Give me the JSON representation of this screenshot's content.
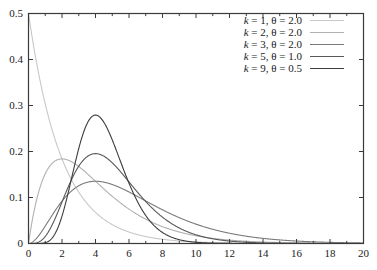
{
  "chart_data": {
    "type": "line",
    "title": "",
    "xlabel": "",
    "ylabel": "",
    "xlim": [
      0,
      20
    ],
    "ylim": [
      0,
      0.5
    ],
    "grid": false,
    "legend_position": "top-right",
    "x_ticks": [
      0,
      2,
      4,
      6,
      8,
      10,
      12,
      14,
      16,
      18,
      20
    ],
    "x_tick_labels": [
      "0",
      "2",
      "4",
      "6",
      "8",
      "10",
      "12",
      "14",
      "16",
      "18",
      "20"
    ],
    "x_minor_ticks": [
      1,
      3,
      5,
      7,
      9,
      11,
      13,
      15,
      17,
      19
    ],
    "y_ticks": [
      0,
      0.1,
      0.2,
      0.3,
      0.4,
      0.5
    ],
    "y_tick_labels": [
      "0",
      "0.1",
      "0.2",
      "0.3",
      "0.4",
      "0.5"
    ],
    "series": [
      {
        "name": "k = 1, θ = 2.0",
        "k": 1,
        "theta": 2.0,
        "color": "#c8c8c8",
        "width": 1.1,
        "peak_x": 0,
        "peak_y": 0.5
      },
      {
        "name": "k = 2, θ = 2.0",
        "k": 2,
        "theta": 2.0,
        "color": "#b0b0b0",
        "width": 1.1,
        "peak_x": 2,
        "peak_y": 0.184
      },
      {
        "name": "k = 3, θ = 2.0",
        "k": 3,
        "theta": 2.0,
        "color": "#7a7a7a",
        "width": 1.1,
        "peak_x": 4,
        "peak_y": 0.135
      },
      {
        "name": "k = 5, θ = 1.0",
        "k": 5,
        "theta": 1.0,
        "color": "#585858",
        "width": 1.1,
        "peak_x": 4,
        "peak_y": 0.195
      },
      {
        "name": "k = 9, θ = 0.5",
        "k": 9,
        "theta": 0.5,
        "color": "#3c3c3c",
        "width": 1.1,
        "peak_x": 4,
        "peak_y": 0.279
      }
    ]
  },
  "legend": {
    "entries": [
      {
        "k_part": "k",
        "rest": " = 1, θ = 2.0"
      },
      {
        "k_part": "k",
        "rest": " = 2, θ = 2.0"
      },
      {
        "k_part": "k",
        "rest": " = 3, θ = 2.0"
      },
      {
        "k_part": "k",
        "rest": " = 5, θ = 1.0"
      },
      {
        "k_part": "k",
        "rest": " = 9, θ = 0.5"
      }
    ]
  },
  "frame": {
    "color": "#3a3a3a",
    "background": "#ffffff"
  }
}
